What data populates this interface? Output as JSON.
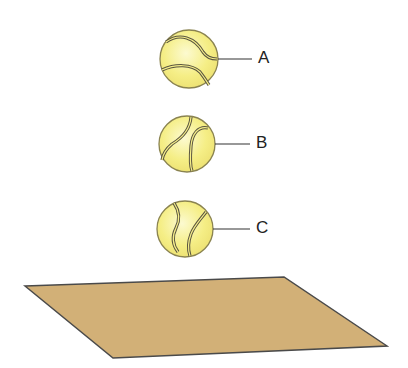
{
  "diagram": {
    "balls": [
      {
        "label": "A",
        "cx": 189,
        "cy": 59,
        "r": 29,
        "seam_orientation": "horizontal"
      },
      {
        "label": "B",
        "cx": 187,
        "cy": 144,
        "r": 28,
        "seam_orientation": "diagonal"
      },
      {
        "label": "C",
        "cx": 185,
        "cy": 229,
        "r": 28,
        "seam_orientation": "vertical"
      }
    ],
    "surface": {
      "points": [
        [
          25,
          286
        ],
        [
          284,
          277
        ],
        [
          387,
          346
        ],
        [
          113,
          358
        ]
      ]
    },
    "colors": {
      "ball_fill": "#f6ef8a",
      "ball_highlight": "#fbf8c6",
      "ball_outline": "#8a8350",
      "seam": "#5a5540",
      "surface_fill": "#d2b077",
      "surface_outline": "#4a4a4a",
      "leader_line": "#333333"
    }
  }
}
